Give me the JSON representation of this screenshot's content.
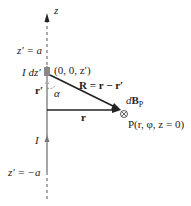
{
  "diagram": {
    "axis_label": "z",
    "top_limit_label": "z′ = a",
    "bottom_limit_label": "z′ = −a",
    "current_element_label": "I dz′",
    "source_point_label": "(0, 0, z′)",
    "R_vector_label": "R = r − r′",
    "r_prime_label": "r′",
    "alpha_label": "α",
    "r_vector_label": "r",
    "field_label": "dB",
    "field_subscript": "P",
    "point_label": "P(r, φ, z = 0)",
    "current_label": "I",
    "into_page_symbol": "⊗",
    "colors": {
      "line": "#222222",
      "wire": "#777777",
      "element": "#888888",
      "arrow_r_prime": "#999999"
    }
  }
}
